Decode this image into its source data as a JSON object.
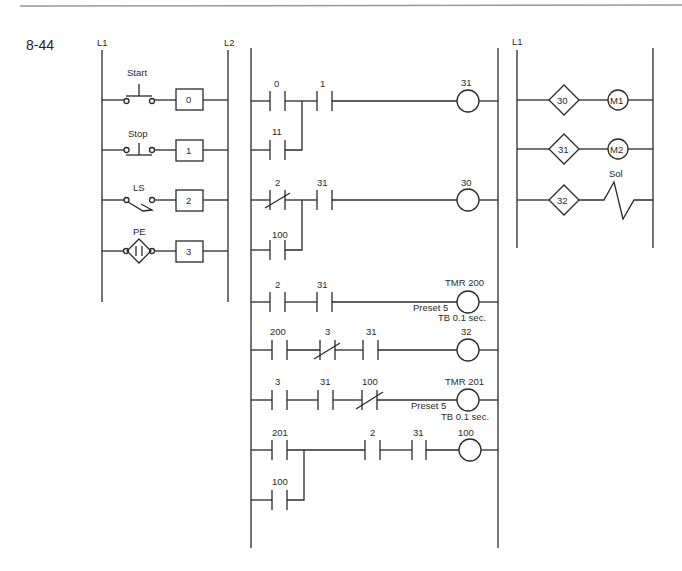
{
  "figure": {
    "number": "8-44"
  },
  "input_panel": {
    "rails": {
      "left": "L1",
      "right": "L2"
    },
    "rungs": [
      {
        "device": "Start",
        "type": "pushbutton-no",
        "address": "0"
      },
      {
        "device": "Stop",
        "type": "pushbutton-nc",
        "address": "1"
      },
      {
        "device": "LS",
        "type": "limit-switch",
        "address": "2"
      },
      {
        "device": "PE",
        "type": "photo-eye",
        "address": "3"
      }
    ]
  },
  "ladder": {
    "rungs": [
      {
        "contacts": [
          "0",
          "1"
        ],
        "branch": [
          "11"
        ],
        "coil": "31"
      },
      {
        "contacts": [
          "2",
          "31"
        ],
        "branch": [
          "100"
        ],
        "coil": "30"
      },
      {
        "contacts": [
          "2",
          "31"
        ],
        "coil": "TMR 200",
        "preset": "Preset 5",
        "timebase": "TB 0.1 sec."
      },
      {
        "contacts": [
          "200",
          "3",
          "31"
        ],
        "coil": "32"
      },
      {
        "contacts": [
          "3",
          "31",
          "100"
        ],
        "coil": "TMR 201",
        "preset": "Preset 5",
        "timebase": "TB 0.1 sec."
      },
      {
        "contacts": [
          "201",
          "2",
          "31"
        ],
        "branch": [
          "100"
        ],
        "coil": "100"
      }
    ]
  },
  "output_panel": {
    "rails": {
      "left": "L1"
    },
    "rungs": [
      {
        "address": "30",
        "load": "M1"
      },
      {
        "address": "31",
        "load": "M2"
      },
      {
        "address": "32",
        "load": "Sol"
      }
    ]
  }
}
